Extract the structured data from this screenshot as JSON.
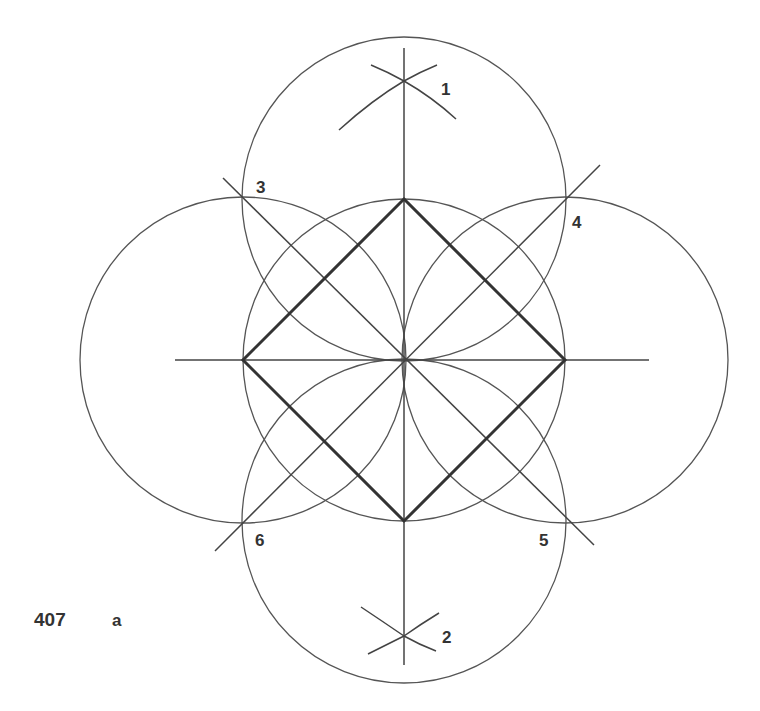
{
  "figure": {
    "number": "407",
    "sublabel": "a",
    "point_labels": [
      "1",
      "2",
      "3",
      "4",
      "5",
      "6"
    ],
    "colors": {
      "line": "#555555",
      "square": "#333333",
      "text": "#333333"
    }
  }
}
